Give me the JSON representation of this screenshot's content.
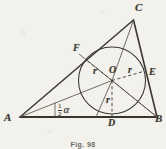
{
  "figure": {
    "caption": "Fig. 98",
    "background_color": "#f2f1ec",
    "ink_color": "#3a3833"
  },
  "labels": {
    "vertex_a": "A",
    "vertex_b": "B",
    "vertex_c": "C",
    "point_d": "D",
    "point_e": "E",
    "point_f": "F",
    "center_o": "O",
    "radius_left": "r",
    "radius_right": "r",
    "radius_bottom": "r",
    "angle_numerator": "1",
    "angle_denominator": "2",
    "angle_symbol": "α"
  },
  "geometry": {
    "triangle": {
      "a": {
        "x": 20,
        "y": 117
      },
      "b": {
        "x": 157,
        "y": 117
      },
      "c": {
        "x": 133.5,
        "y": 20
      }
    },
    "incircle": {
      "center": {
        "x": 112,
        "y": 80.5
      },
      "radius": 33.5
    },
    "tangent_points": {
      "d": {
        "x": 112,
        "y": 117
      },
      "e": {
        "x": 144.2,
        "y": 71.2
      },
      "f": {
        "x": 86.0,
        "y": 59.6
      }
    },
    "angle_mark": {
      "tick_x": 55,
      "tick_top_y": 103,
      "tick_bottom_y": 117
    }
  },
  "label_positions": {
    "vertex_a": {
      "x": 5,
      "y": 115
    },
    "vertex_b": {
      "x": 156,
      "y": 116
    },
    "vertex_c": {
      "x": 135,
      "y": 4
    },
    "point_d": {
      "x": 109,
      "y": 119
    },
    "point_e": {
      "x": 148,
      "y": 68
    },
    "point_f": {
      "x": 74,
      "y": 44
    },
    "center_o": {
      "x": 109,
      "y": 66
    },
    "radius_left": {
      "x": 94,
      "y": 67
    },
    "radius_right": {
      "x": 127,
      "y": 66
    },
    "radius_bottom": {
      "x": 106,
      "y": 96
    },
    "angle": {
      "x": 58,
      "y": 104
    }
  }
}
